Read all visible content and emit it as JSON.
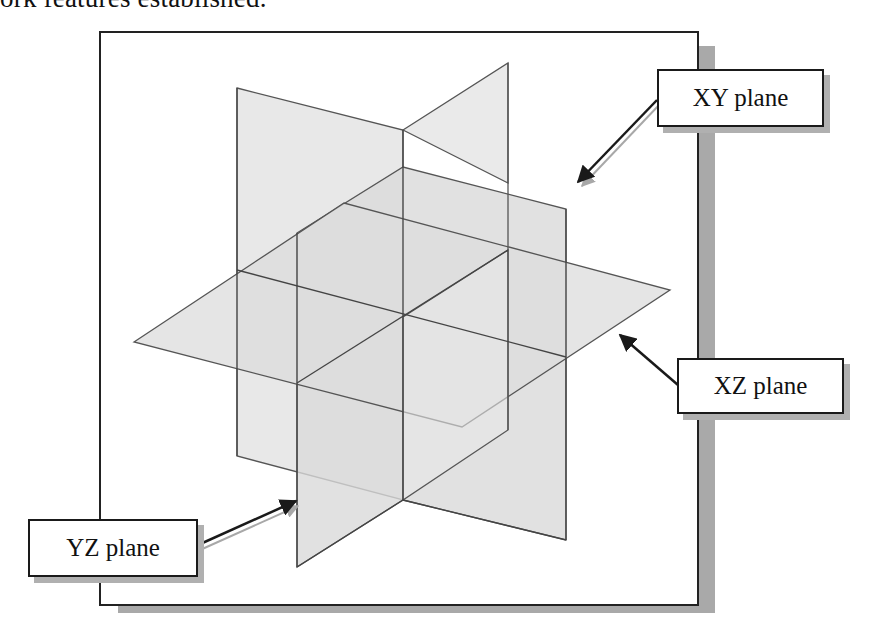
{
  "caption": {
    "text": "ork features established."
  },
  "labels": {
    "xy": "XY plane",
    "xz": "XZ plane",
    "yz": "YZ plane"
  },
  "colors": {
    "plane_fill": "#d9d9d9",
    "plane_stroke": "#555555",
    "frame_border": "#222222",
    "frame_shadow": "#a9a9a9",
    "arrow": "#1a1a1a",
    "arrow_shadow": "#a0a0a0"
  }
}
